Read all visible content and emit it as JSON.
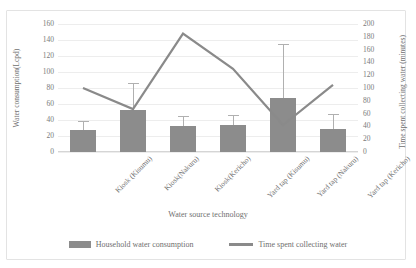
{
  "chart_data": {
    "type": "bar",
    "title": "Source of water",
    "categories": [
      "Kiosk (Kisumu)",
      "Kiosk(Nakuru)",
      "Kiosk(Kericho)",
      "Yard tap (Kisumu)",
      "Yard tap (Nakuru)",
      "Yard tap (Kericho)"
    ],
    "xlabel": "Water source technology",
    "ylabel": "Water consumption(Lcpd)",
    "y2label": "Time spent collecting water (minutes)",
    "ylim": [
      0,
      160
    ],
    "y2lim": [
      0,
      200
    ],
    "yticks": [
      0,
      20,
      40,
      60,
      80,
      100,
      120,
      140,
      160
    ],
    "y2ticks": [
      0,
      20,
      40,
      60,
      80,
      100,
      120,
      140,
      160,
      180,
      200
    ],
    "grid": true,
    "legend_position": "bottom",
    "series": [
      {
        "name": "Household water consumption",
        "type": "bar",
        "axis": "left",
        "color": "#8c8c8c",
        "values": [
          27,
          53,
          32,
          34,
          67,
          29
        ],
        "error_high": [
          39,
          86,
          45,
          46,
          135,
          47
        ]
      },
      {
        "name": "Time spent collecting water",
        "type": "line",
        "axis": "right",
        "color": "#8a8a8a",
        "values": [
          100,
          67,
          185,
          130,
          42,
          105
        ]
      }
    ]
  },
  "legend": {
    "items": [
      {
        "label": "Household water consumption",
        "marker": "bar-swatch"
      },
      {
        "label": "Time spent collecting water",
        "marker": "line-swatch"
      }
    ]
  }
}
